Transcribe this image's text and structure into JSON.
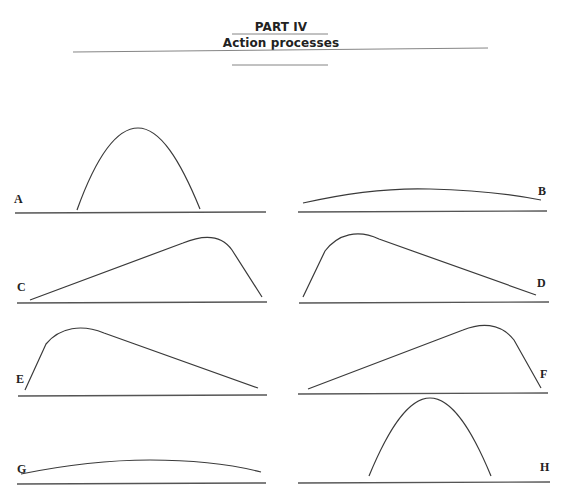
{
  "header": {
    "part": "PART IV",
    "title": "Action processes"
  },
  "figure": {
    "panels": [
      {
        "label": "A",
        "shape": "narrow symmetric peak"
      },
      {
        "label": "B",
        "shape": "flat broad symmetric curve"
      },
      {
        "label": "C",
        "shape": "slow rise, late peak, sharp drop"
      },
      {
        "label": "D",
        "shape": "sharp rise, early peak, slow decline"
      },
      {
        "label": "E",
        "shape": "sharp rise, early peak, slow decline"
      },
      {
        "label": "F",
        "shape": "slow rise, late peak, sharp drop"
      },
      {
        "label": "G",
        "shape": "flat broad symmetric curve"
      },
      {
        "label": "H",
        "shape": "narrow symmetric peak"
      }
    ]
  },
  "caption": {
    "visible": "partially cropped caption line at bottom edge"
  }
}
